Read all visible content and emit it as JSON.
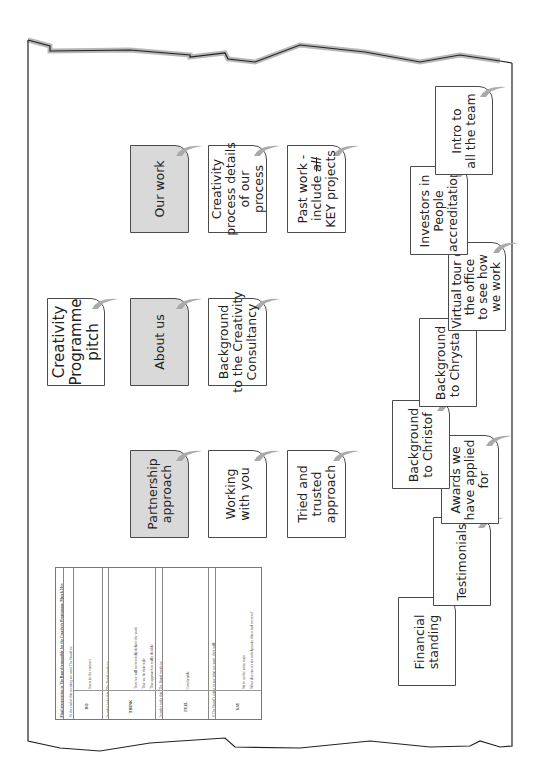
{
  "title_card": {
    "lines": [
      "Creativity",
      "Programme",
      "pitch"
    ]
  },
  "sections": [
    {
      "heading": "Partnership approach",
      "lines": [
        "Partnership",
        "approach"
      ],
      "children": [
        {
          "lines": [
            "Working",
            "with you"
          ]
        },
        {
          "lines": [
            "Tried and",
            "trusted",
            "approach"
          ]
        }
      ]
    },
    {
      "heading": "About us",
      "lines": [
        "About us"
      ],
      "children": [
        {
          "lines": [
            "Background",
            "to the Creativity",
            "Consultancy"
          ]
        }
      ]
    },
    {
      "heading": "Our work",
      "lines": [
        "Our work"
      ],
      "children": [
        {
          "lines": [
            "Creativity",
            "process details",
            "of our",
            "process"
          ]
        },
        {
          "lines": [
            "Past work -",
            "include all",
            "KEY projects"
          ],
          "struck_word": "all"
        }
      ]
    }
  ],
  "credentials_notes": [
    {
      "lines": [
        "Financial",
        "standing"
      ]
    },
    {
      "lines": [
        "Testimonials"
      ]
    },
    {
      "lines": [
        "Awards we",
        "have applied",
        "for"
      ]
    },
    {
      "lines": [
        "Background",
        "to Christof"
      ]
    },
    {
      "lines": [
        "Background",
        "to Chrystal"
      ]
    },
    {
      "lines": [
        "Virtual tour of",
        "the office",
        "to see how",
        "we work"
      ]
    },
    {
      "lines": [
        "Investors in",
        "People",
        "accreditation"
      ]
    },
    {
      "lines": [
        "Intro to",
        "all the team"
      ]
    }
  ],
  "planning_table": {
    "title": "Final presentation to The Board responsible for the Creativity Programme, March 20xx",
    "rows": [
      {
        "label": "DO",
        "intro": "At the end of this meeting we want The Board to:",
        "bullets": [
          "Invest in the contract"
        ]
      },
      {
        "label": "THINK",
        "intro": "In order to do this, The Board needs to:",
        "bullets": [
          "Trust we will successfully deliver the work",
          "That we fit their style",
          "That approach is really flexible",
          "That will work with us to make the project a long term success"
        ]
      },
      {
        "label": "FEEL",
        "intro": "In order to do this, The Board needs to:",
        "bullets": [
          "Comfortable"
        ]
      },
      {
        "label": "SAY",
        "intro": "If The Board's going to say what we want, they will:",
        "bullets": [
          "We're on the same team",
          "What else can we do to help make this a real success?"
        ]
      }
    ]
  },
  "colors": {
    "heading_fill": "#d9d9d9",
    "note_fill": "#ffffff",
    "border": "#4a4a4a",
    "edge_shadow": "#b5b5b5"
  }
}
